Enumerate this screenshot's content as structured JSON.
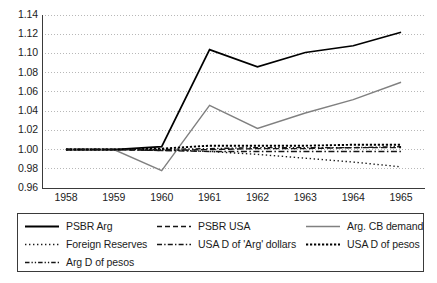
{
  "chart_data": {
    "type": "line",
    "title": "",
    "subtitle": "",
    "xlabel": "",
    "ylabel": "",
    "x": [
      1958,
      1959,
      1960,
      1961,
      1962,
      1963,
      1964,
      1965
    ],
    "categories": [
      "1958",
      "1959",
      "1960",
      "1961",
      "1962",
      "1963",
      "1964",
      "1965"
    ],
    "xtick_labels": [
      "1958",
      "1959",
      "1960",
      "1961",
      "1962",
      "1963",
      "1964",
      "1965"
    ],
    "ytick_labels": [
      "1.14",
      "1.12",
      "1.10",
      "1.08",
      "1.06",
      "1.04",
      "1.02",
      "1.00",
      "0.98",
      "0.96"
    ],
    "ylim": [
      0.96,
      1.14
    ],
    "ytick_step": 0.02,
    "grid": "horizontal-dotted",
    "legend_position": "bottom",
    "legend_columns": 3,
    "series": [
      {
        "name": "PSBR Arg",
        "style": "solid",
        "color": "#000000",
        "width": 1.7,
        "values": [
          1.0,
          1.0,
          1.003,
          1.104,
          1.086,
          1.101,
          1.108,
          1.122
        ]
      },
      {
        "name": "PSBR USA",
        "style": "dashed",
        "color": "#151515",
        "width": 1.4,
        "values": [
          1.0,
          1.0,
          0.999,
          1.0,
          1.001,
          1.001,
          1.002,
          1.002
        ]
      },
      {
        "name": "Arg. CB demand",
        "style": "solid",
        "color": "#808080",
        "width": 1.4,
        "values": [
          1.0,
          1.0,
          0.978,
          1.046,
          1.022,
          1.038,
          1.052,
          1.07
        ]
      },
      {
        "name": "Foreign Reserves",
        "style": "dotted",
        "color": "#1a1a1a",
        "width": 1.4,
        "values": [
          1.0,
          1.0,
          1.0,
          0.998,
          0.995,
          0.991,
          0.987,
          0.982
        ]
      },
      {
        "name": "USA D of 'Arg' dollars",
        "style": "dashdot",
        "color": "#151515",
        "width": 1.4,
        "values": [
          1.0,
          1.0,
          0.999,
          0.998,
          0.998,
          0.998,
          0.998,
          0.998
        ]
      },
      {
        "name": "USA D of pesos",
        "style": "densely-dotted",
        "color": "#000000",
        "width": 1.9,
        "values": [
          1.0,
          1.0,
          1.001,
          1.004,
          1.004,
          1.004,
          1.005,
          1.005
        ]
      },
      {
        "name": "Arg D of pesos",
        "style": "dashdotdot",
        "color": "#151515",
        "width": 1.4,
        "values": [
          1.0,
          1.0,
          1.0,
          1.001,
          1.002,
          1.002,
          1.002,
          1.003
        ]
      }
    ]
  },
  "legend": {
    "items": [
      {
        "label": "PSBR Arg",
        "swatch": "solid-black"
      },
      {
        "label": "PSBR USA",
        "swatch": "dashed-black"
      },
      {
        "label": "Arg. CB demand",
        "swatch": "solid-gray"
      },
      {
        "label": "Foreign Reserves",
        "swatch": "dotted-black"
      },
      {
        "label": "USA D of 'Arg' dollars",
        "swatch": "dashdot-black"
      },
      {
        "label": "USA D of pesos",
        "swatch": "densely-dotted-black"
      },
      {
        "label": "Arg D of pesos",
        "swatch": "dashdotdot-black"
      }
    ]
  },
  "colors": {
    "axis": "#3a3a3a",
    "grid": "#b8b8b8",
    "series_black": "#000000",
    "series_gray": "#808080",
    "background": "#ffffff"
  }
}
